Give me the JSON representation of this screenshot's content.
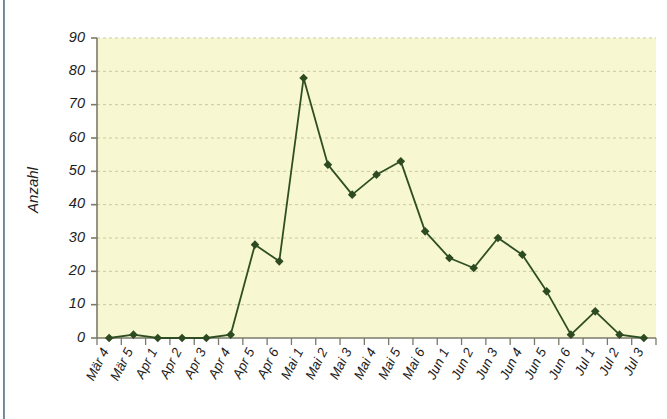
{
  "chart_data": {
    "type": "line",
    "title": "",
    "xlabel": "",
    "ylabel": "Anzahl",
    "ylim": [
      0,
      90
    ],
    "yticks": [
      0,
      10,
      20,
      30,
      40,
      50,
      60,
      70,
      80,
      90
    ],
    "grid": true,
    "legend": "none",
    "marker": "diamond",
    "categories": [
      "Mär 4",
      "Mär 5",
      "Apr 1",
      "Apr 2",
      "Apr 3",
      "Apr 4",
      "Apr 5",
      "Apr 6",
      "Mai 1",
      "Mai 2",
      "Mai 3",
      "Mai 4",
      "Mai 5",
      "Mai 6",
      "Jun 1",
      "Jun 2",
      "Jun 3",
      "Jun 4",
      "Jun 5",
      "Jun 6",
      "Jul 1",
      "Jul 2",
      "Jul 3"
    ],
    "values": [
      0,
      1,
      0,
      0,
      0,
      1,
      28,
      23,
      78,
      52,
      43,
      49,
      53,
      32,
      24,
      21,
      30,
      25,
      14,
      1,
      8,
      1,
      0
    ],
    "series": [
      {
        "name": "Anzahl",
        "values": [
          0,
          1,
          0,
          0,
          0,
          1,
          28,
          23,
          78,
          52,
          43,
          49,
          53,
          32,
          24,
          21,
          30,
          25,
          14,
          1,
          8,
          1,
          0
        ]
      }
    ]
  },
  "style": {
    "plot_background": "#f7f7d2",
    "line_color": "#2f4f23",
    "marker_color": "#2d4a21",
    "grid_color": "#c9c9a0",
    "axis_color": "#7a7a6a",
    "text_color": "#1c1c1c",
    "page_background": "#ffffff",
    "left_rule_color": "#3f5a73"
  },
  "layout": {
    "plot_left": 97,
    "plot_right": 656,
    "plot_top": 38,
    "plot_bottom": 338
  }
}
